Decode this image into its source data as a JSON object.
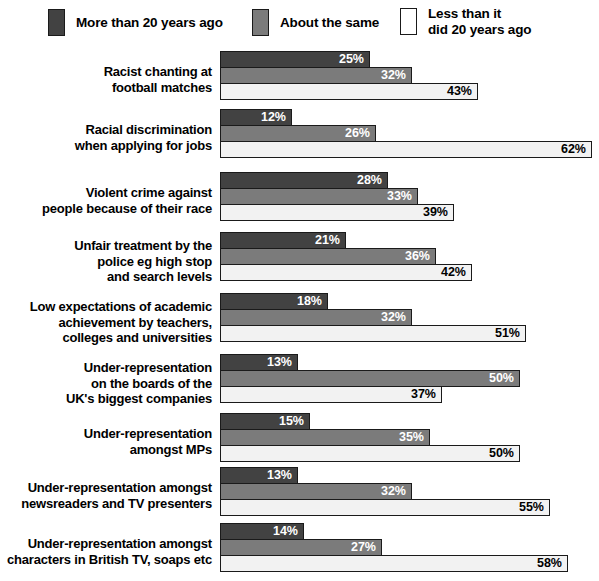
{
  "legend": {
    "items": [
      {
        "label": "More than 20 years ago",
        "color": "#424242",
        "x": 48,
        "text_x": 48
      },
      {
        "label": "About the same",
        "color": "#7b7b7b",
        "x": 252,
        "text_x": 252
      },
      {
        "label": "Less than it\ndid 20 years ago",
        "color": "#ffffff",
        "x": 400,
        "text_x": 400
      }
    ]
  },
  "chart_data": {
    "type": "bar",
    "orientation": "horizontal",
    "title": "",
    "subtitle": "",
    "xlabel": "",
    "ylabel": "",
    "xlim": [
      0,
      62
    ],
    "grid": false,
    "legend_position": "top",
    "value_suffix": "%",
    "categories": [
      "Racist chanting at\nfootball matches",
      "Racial discrimination\nwhen applying for jobs",
      "Violent crime against\npeople because of their race",
      "Unfair treatment by the\npolice eg high stop\nand search levels",
      "Low expectations of academic\nachievement by teachers,\ncolleges and universities",
      "Under-representation\non the boards of the\nUK's biggest companies",
      "Under-representation\namongst MPs",
      "Under-representation amongst\nnewsreaders and TV presenters",
      "Under-representation amongst\ncharacters in British TV, soaps etc"
    ],
    "series": [
      {
        "name": "More than 20 years ago",
        "color": "#424242",
        "values": [
          25,
          12,
          28,
          21,
          18,
          13,
          15,
          13,
          14
        ],
        "labels": [
          "25%",
          "12%",
          "28%",
          "21%",
          "18%",
          "13%",
          "15%",
          "13%",
          "14%"
        ]
      },
      {
        "name": "About the same",
        "color": "#7b7b7b",
        "values": [
          32,
          26,
          33,
          36,
          32,
          50,
          35,
          32,
          27
        ],
        "labels": [
          "32%",
          "26%",
          "33%",
          "36%",
          "32%",
          "50%",
          "35%",
          "32%",
          "27%"
        ]
      },
      {
        "name": "Less than it did 20 years ago",
        "color": "#f2f2f2",
        "values": [
          43,
          62,
          39,
          42,
          51,
          37,
          50,
          55,
          58
        ],
        "labels": [
          "43%",
          "62%",
          "39%",
          "42%",
          "51%",
          "37%",
          "50%",
          "55%",
          "58%"
        ]
      }
    ]
  },
  "layout": {
    "px_per_percent": 6.0,
    "group_tops": [
      5,
      63,
      126,
      186,
      247,
      308,
      367,
      421,
      477
    ],
    "label_tops": [
      18,
      76,
      139,
      192,
      253,
      314,
      380,
      434,
      490
    ]
  }
}
